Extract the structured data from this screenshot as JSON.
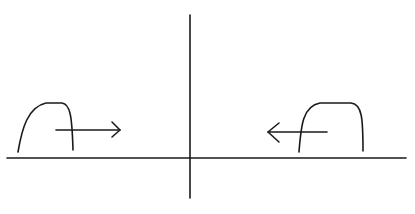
{
  "diagram": {
    "stroke_color": "#1a1a1a",
    "background": "#ffffff",
    "elements": {
      "baseline": {
        "x1": 7,
        "y1": 158,
        "x2": 406,
        "y2": 158
      },
      "center_line": {
        "x1": 190,
        "y1": 15,
        "x2": 190,
        "y2": 198
      },
      "left_pulse": {
        "direction": "right"
      },
      "right_pulse": {
        "direction": "left"
      }
    }
  }
}
